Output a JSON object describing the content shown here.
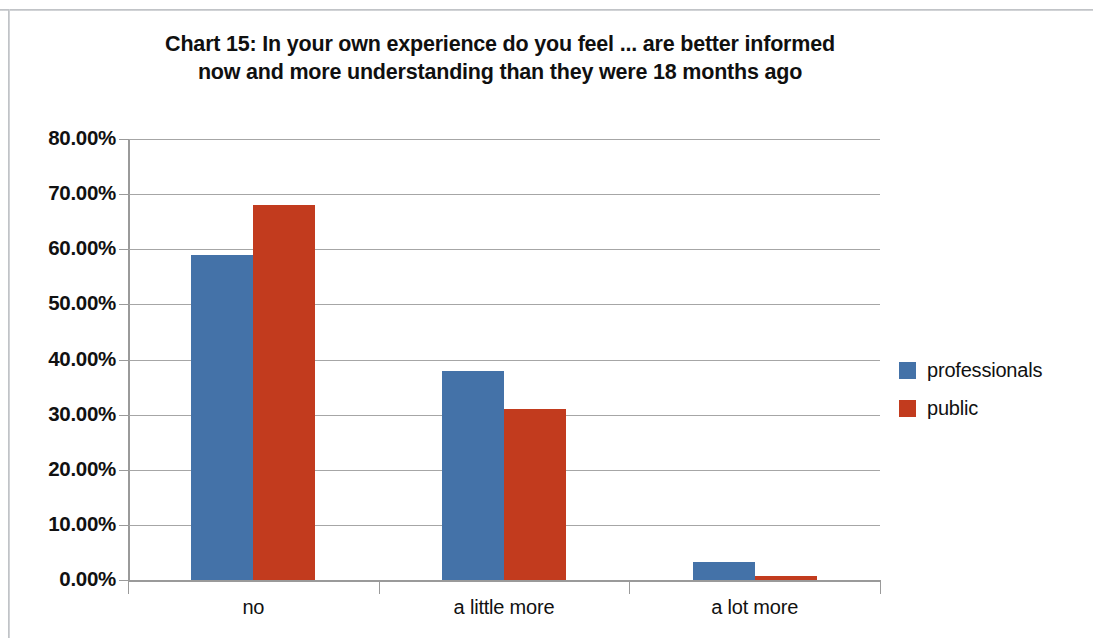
{
  "chart_data": {
    "type": "bar",
    "title": "Chart 15: In your own experience do you feel ... are better informed now and more understanding than they were 18 months ago",
    "title_line1": "Chart 15: In your own experience do you feel ... are better informed",
    "title_line2": "now and more understanding than they were 18 months ago",
    "xlabel": "",
    "ylabel": "",
    "categories": [
      "no",
      "a little more",
      "a lot more"
    ],
    "series": [
      {
        "name": "professionals",
        "color": "#4472A8",
        "values": [
          59.0,
          38.0,
          3.3
        ]
      },
      {
        "name": "public",
        "color": "#C23B1E",
        "values": [
          68.0,
          31.0,
          0.8
        ]
      }
    ],
    "ylim": [
      0,
      80
    ],
    "ytick_values": [
      0,
      10,
      20,
      30,
      40,
      50,
      60,
      70,
      80
    ],
    "ytick_labels": [
      "0.00%",
      "10.00%",
      "20.00%",
      "30.00%",
      "40.00%",
      "50.00%",
      "60.00%",
      "70.00%",
      "80.00%"
    ],
    "grid": true,
    "legend_position": "right",
    "value_format": "percent"
  },
  "legend": {
    "entries": [
      {
        "label": "professionals",
        "color": "#4472A8"
      },
      {
        "label": "public",
        "color": "#C23B1E"
      }
    ]
  },
  "colors": {
    "series_blue": "#4472A8",
    "series_red": "#C23B1E",
    "gridline": "#A6A6A6",
    "axis": "#9A9A9A",
    "text": "#111111",
    "frame": "#B9BCC0",
    "background": "#FFFFFF"
  }
}
